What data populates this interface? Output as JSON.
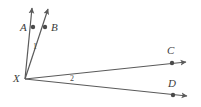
{
  "figure": {
    "type": "geometry-diagram",
    "background_color": "#ffffff",
    "stroke_color": "#5a5a5a",
    "label_color": "#3b3b3b",
    "vertex": {
      "name": "X",
      "label": "X",
      "x": 25,
      "y": 79,
      "label_x": 13,
      "label_y": 73
    },
    "points": [
      {
        "name": "A",
        "label": "A",
        "x": 33,
        "y": 27,
        "label_x": 20,
        "label_y": 22,
        "dot": true
      },
      {
        "name": "B",
        "label": "B",
        "x": 45,
        "y": 27,
        "label_x": 51,
        "label_y": 22,
        "dot": true
      },
      {
        "name": "C",
        "label": "C",
        "x": 172,
        "y": 63,
        "label_x": 167,
        "label_y": 45,
        "dot": true
      },
      {
        "name": "D",
        "label": "D",
        "x": 173,
        "y": 95,
        "label_x": 168,
        "label_y": 78,
        "dot": true
      }
    ],
    "rays": [
      {
        "name": "ray-XA",
        "from": "X",
        "through": "A",
        "x1": 25,
        "y1": 79,
        "x2": 32,
        "y2": 8,
        "arrow": true
      },
      {
        "name": "ray-XB",
        "from": "X",
        "through": "B",
        "x1": 25,
        "y1": 79,
        "x2": 48,
        "y2": 9,
        "arrow": true
      },
      {
        "name": "ray-XC",
        "from": "X",
        "through": "C",
        "x1": 25,
        "y1": 79,
        "x2": 186,
        "y2": 62,
        "arrow": true
      },
      {
        "name": "ray-XD",
        "from": "X",
        "through": "D",
        "x1": 25,
        "y1": 79,
        "x2": 187,
        "y2": 96,
        "arrow": true
      }
    ],
    "angles": [
      {
        "name": "angle-1",
        "label": "1",
        "between": "ray-XA and ray-XB",
        "label_x": 33,
        "label_y": 43
      },
      {
        "name": "angle-2",
        "label": "2",
        "between": "ray-XC and ray-XD",
        "label_x": 70,
        "label_y": 75
      }
    ]
  }
}
